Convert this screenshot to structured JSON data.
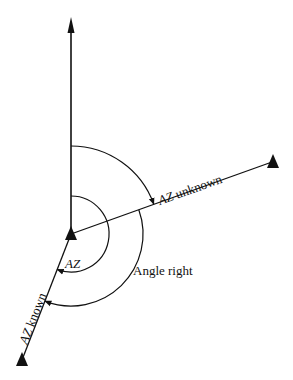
{
  "diagram": {
    "type": "azimuth-angle-right",
    "colors": {
      "line": "#111111",
      "background": "#ffffff"
    },
    "points": {
      "station": {
        "x": 71,
        "y": 234,
        "symbol": "triangle"
      },
      "forward_station": {
        "x": 272,
        "y": 162,
        "symbol": "triangle"
      },
      "backsight_station": {
        "x": 22,
        "y": 360,
        "symbol": "triangle"
      },
      "north_arrow_tip": {
        "x": 71,
        "y": 18,
        "symbol": "arrowhead"
      }
    },
    "lines": [
      {
        "id": "north-meridian",
        "from": "station",
        "to": "north_arrow_tip"
      },
      {
        "id": "az-unknown-line",
        "from": "station",
        "to": "forward_station"
      },
      {
        "id": "az-known-line",
        "from": "station",
        "to": "backsight_station"
      }
    ],
    "arcs": [
      {
        "id": "az-unknown-arc",
        "radius": 88,
        "from": "north",
        "to": "az-unknown-line",
        "direction": "clockwise"
      },
      {
        "id": "az-known-arc",
        "radius": 38,
        "from": "north",
        "to": "az-known-line",
        "direction": "clockwise"
      },
      {
        "id": "angle-right-arc",
        "radius": 72,
        "from": "az-unknown-line",
        "to": "az-known-line",
        "direction": "clockwise"
      }
    ],
    "labels": {
      "az_unknown": {
        "italic_part": "AZ",
        "rest": " unknown"
      },
      "az_known": {
        "italic_part": "AZ",
        "rest": " known"
      },
      "az": "AZ",
      "angle_right": "Angle right"
    }
  }
}
